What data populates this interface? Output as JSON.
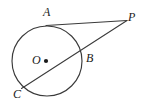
{
  "figure": {
    "kind": "circle-tangent-secant-diagram",
    "background_color": "#ffffff",
    "stroke_color": "#3a3a3a",
    "label_color": "#1a1a1a",
    "labels": {
      "a": "A",
      "b": "B",
      "c": "C",
      "o": "O",
      "p": "P"
    },
    "circle": {
      "name": "circle-O",
      "center_x": 47,
      "center_y": 61,
      "radius": 35
    },
    "center_dot": {
      "name": "center-point-O",
      "x": 46,
      "y": 61,
      "radius": 2.1
    },
    "tangent_line": {
      "name": "tangent-AP",
      "x1": 46,
      "y1": 25.6,
      "x2": 127,
      "y2": 20.5
    },
    "secant_line": {
      "name": "secant-CP",
      "x1": 21.5,
      "y1": 88.5,
      "x2": 127,
      "y2": 20.5
    },
    "points": {
      "a": {
        "x": 46,
        "y": 25.6
      },
      "b": {
        "x": 81.5,
        "y": 52.5
      },
      "c": {
        "x": 21.5,
        "y": 88.5
      },
      "p": {
        "x": 127,
        "y": 20.5
      }
    }
  }
}
